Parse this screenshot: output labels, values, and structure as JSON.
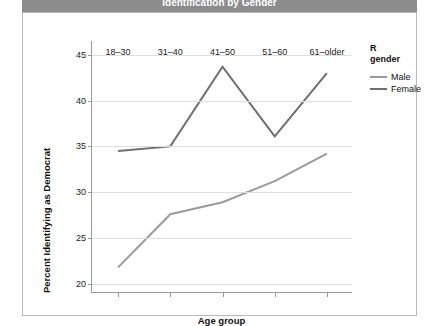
{
  "window": {
    "title": "Identification by Gender"
  },
  "legend": {
    "title_line1": "R",
    "title_line2": "gender",
    "items": [
      {
        "label": "Male",
        "color": "#9b9b9b"
      },
      {
        "label": "Female",
        "color": "#6f6f6f"
      }
    ]
  },
  "chart_data": {
    "type": "line",
    "title": "Identification by Gender",
    "xlabel": "Age group",
    "ylabel": "Percent Identifying as Democrat",
    "categories": [
      "18–30",
      "31–40",
      "41–50",
      "51–60",
      "61–older"
    ],
    "ylim": [
      19,
      46.5
    ],
    "yticks": [
      20,
      25,
      30,
      35,
      40,
      45
    ],
    "grid": "horizontal",
    "legend_position": "right",
    "series": [
      {
        "name": "Male",
        "color": "#9b9b9b",
        "values": [
          21.8,
          27.6,
          28.9,
          31.2,
          34.2
        ]
      },
      {
        "name": "Female",
        "color": "#6f6f6f",
        "values": [
          34.5,
          35.0,
          43.7,
          36.1,
          43.0
        ]
      }
    ]
  }
}
